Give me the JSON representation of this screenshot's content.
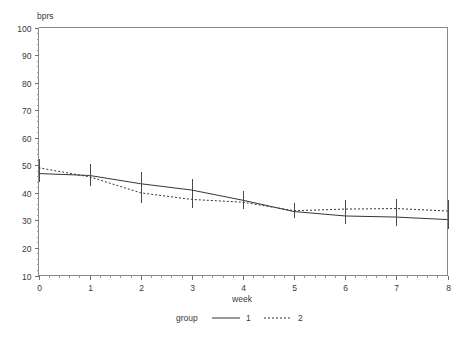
{
  "chart_data": {
    "type": "line",
    "title": "",
    "subtitle": "",
    "xlabel": "week",
    "ylabel": "bprs",
    "xlim": [
      0,
      8
    ],
    "ylim": [
      10,
      100
    ],
    "grid": false,
    "x": [
      0,
      1,
      2,
      3,
      4,
      5,
      6,
      7,
      8
    ],
    "xticks": [
      "0",
      "1",
      "2",
      "3",
      "4",
      "5",
      "6",
      "7",
      "8"
    ],
    "yticks": [
      "10",
      "20",
      "30",
      "40",
      "50",
      "60",
      "70",
      "80",
      "90",
      "100"
    ],
    "legend": {
      "title": "group",
      "position": "bottom",
      "entries": [
        {
          "label": "1",
          "style": "solid"
        },
        {
          "label": "2",
          "style": "dotted"
        }
      ]
    },
    "series": [
      {
        "name": "1",
        "style": "solid",
        "values": [
          47.0,
          46.3,
          43.3,
          41.0,
          37.3,
          33.2,
          31.6,
          31.2,
          30.3
        ],
        "errors": [
          3.0,
          4.0,
          4.2,
          4.0,
          3.3,
          2.4,
          3.0,
          3.2,
          3.4
        ]
      },
      {
        "name": "2",
        "style": "dotted",
        "values": [
          49.1,
          45.8,
          40.0,
          37.6,
          36.6,
          33.5,
          34.1,
          34.3,
          33.4
        ],
        "errors": [
          3.2,
          3.5,
          3.6,
          3.2,
          2.6,
          2.7,
          3.2,
          3.6,
          4.0
        ]
      }
    ]
  },
  "axis": {
    "y_label": "bprs",
    "x_label": "week"
  }
}
